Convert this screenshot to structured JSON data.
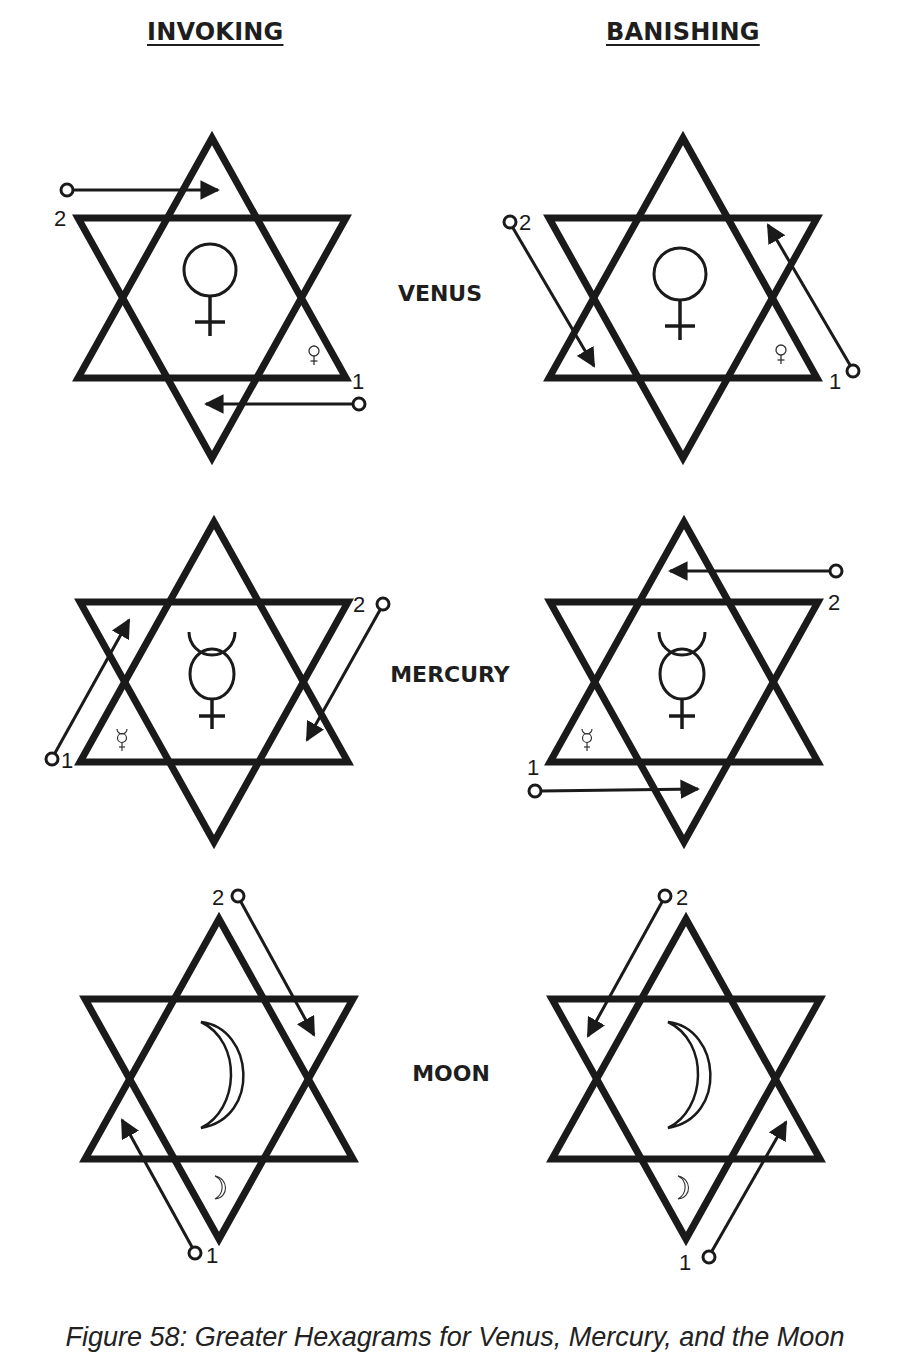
{
  "headers": {
    "invoking": "INVOKING",
    "banishing": "BANISHING"
  },
  "planets": [
    {
      "name": "VENUS",
      "symbol": "venus-symbol",
      "invoking": {
        "start_label": "1",
        "end_label": "2",
        "description": "Line 1 enters right of base heading left; line 2 enters top-left heading right"
      },
      "banishing": {
        "start_label": "1",
        "end_label": "2",
        "description": "Line 1 from bottom-right heading up-left; line 2 from top-left heading down-right"
      }
    },
    {
      "name": "MERCURY",
      "symbol": "mercury-symbol",
      "invoking": {
        "start_label": "1",
        "end_label": "2",
        "description": "Line 1 from bottom-left heading up-right; line 2 from top-right heading down-left"
      },
      "banishing": {
        "start_label": "1",
        "end_label": "2",
        "description": "Line 1 from lower-left heading right; line 2 from upper-right heading left"
      }
    },
    {
      "name": "MOON",
      "symbol": "moon-symbol",
      "invoking": {
        "start_label": "1",
        "end_label": "2",
        "description": "Line 1 from bottom heading up-left; line 2 from top heading down-right"
      },
      "banishing": {
        "start_label": "1",
        "end_label": "2",
        "description": "Line 1 from bottom heading up-right; line 2 from top heading down-left"
      }
    }
  ],
  "caption": "Figure 58: Greater Hexagrams for Venus, Mercury, and the Moon",
  "colors": {
    "ink": "#1a1a1a",
    "background": "#ffffff"
  }
}
